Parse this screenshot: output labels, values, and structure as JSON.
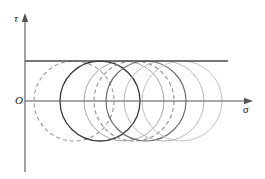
{
  "figure": {
    "background_color": "#ffffff"
  },
  "axes": {
    "vertical": {
      "label": "τ",
      "name": "tau-axis",
      "color": "#555555",
      "x": 25,
      "y_top": 18,
      "y_bottom": 172,
      "arrow": "up"
    },
    "horizontal": {
      "label": "σ",
      "name": "sigma-axis",
      "color": "#555555",
      "y": 101,
      "x_left": 25,
      "x_right": 248,
      "arrow": "right"
    },
    "origin": {
      "label": "O",
      "x": 25,
      "y": 101
    }
  },
  "envelope_line": {
    "name": "failure-envelope-line",
    "label": "",
    "color": "#4a4a4a",
    "y": 61,
    "x_start": 25,
    "x_end": 228,
    "stroke_width": 1.3
  },
  "chart_data": {
    "type": "line",
    "xlabel": "σ",
    "ylabel": "τ",
    "grid": false,
    "legend": "none",
    "axis_origin": [
      25,
      101
    ],
    "envelope_line_y": 61,
    "circle_radius": 40,
    "circles": [
      {
        "name": "circle-1",
        "center_x": 74,
        "center_y": 101,
        "radius": 40,
        "style": "dashed",
        "color": "#9a9a9a",
        "stroke_width": 1.1,
        "dash": "4,3"
      },
      {
        "name": "circle-2",
        "center_x": 100,
        "center_y": 101,
        "radius": 40,
        "style": "solid",
        "color": "#3a3a3a",
        "stroke_width": 1.3,
        "dash": "none"
      },
      {
        "name": "circle-3",
        "center_x": 124,
        "center_y": 101,
        "radius": 40,
        "style": "solid",
        "color": "#a6a6a6",
        "stroke_width": 1.0,
        "dash": "none"
      },
      {
        "name": "circle-4",
        "center_x": 134,
        "center_y": 101,
        "radius": 40,
        "style": "dashed",
        "color": "#8f8f8f",
        "stroke_width": 1.1,
        "dash": "4,3"
      },
      {
        "name": "circle-5",
        "center_x": 146,
        "center_y": 101,
        "radius": 40,
        "style": "solid",
        "color": "#6e6e6e",
        "stroke_width": 1.2,
        "dash": "none"
      },
      {
        "name": "circle-6",
        "center_x": 164,
        "center_y": 101,
        "radius": 40,
        "style": "solid",
        "color": "#b8b8b8",
        "stroke_width": 1.0,
        "dash": "none"
      },
      {
        "name": "circle-7",
        "center_x": 182,
        "center_y": 101,
        "radius": 40,
        "style": "solid",
        "color": "#c4c4c4",
        "stroke_width": 1.0,
        "dash": "none"
      }
    ]
  }
}
